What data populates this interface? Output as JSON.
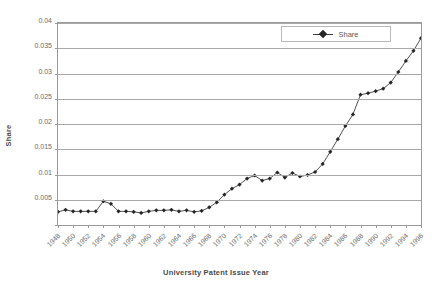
{
  "chart_data": {
    "type": "line",
    "title": "",
    "xlabel": "University Patent Issue Year",
    "ylabel": "Share",
    "xlim": [
      1948,
      1996
    ],
    "ylim": [
      0,
      0.04
    ],
    "grid": true,
    "legend_position": "top-right",
    "y_ticks": [
      0,
      0.005,
      0.01,
      0.015,
      0.02,
      0.025,
      0.03,
      0.035,
      0.04
    ],
    "y_tick_labels": [
      "",
      "0.005",
      "0.01",
      "0.015",
      "0.02",
      "0.025",
      "0.03",
      "0.035",
      "0.04"
    ],
    "x_ticks": [
      1948,
      1950,
      1952,
      1954,
      1956,
      1958,
      1960,
      1962,
      1964,
      1966,
      1968,
      1970,
      1972,
      1974,
      1976,
      1978,
      1980,
      1982,
      1984,
      1986,
      1988,
      1990,
      1992,
      1994,
      1996
    ],
    "x_tick_labels": [
      "1948",
      "1950",
      "1952",
      "1954",
      "1956",
      "1958",
      "1960",
      "1962",
      "1964",
      "1966",
      "1968",
      "1970",
      "1972",
      "1974",
      "1976",
      "1978",
      "1980",
      "1982",
      "1984",
      "1986",
      "1988",
      "1990",
      "1992",
      "1994",
      "1996"
    ],
    "series": [
      {
        "name": "Share",
        "color": "#262626",
        "marker": "diamond",
        "x": [
          1948,
          1949,
          1950,
          1951,
          1952,
          1953,
          1954,
          1955,
          1956,
          1957,
          1958,
          1959,
          1960,
          1961,
          1962,
          1963,
          1964,
          1965,
          1966,
          1967,
          1968,
          1969,
          1970,
          1971,
          1972,
          1973,
          1974,
          1975,
          1976,
          1977,
          1978,
          1979,
          1980,
          1981,
          1982,
          1983,
          1984,
          1985,
          1986,
          1987,
          1988,
          1989,
          1990,
          1991,
          1992,
          1993,
          1994,
          1995,
          1996
        ],
        "values": [
          0.0026,
          0.003,
          0.0027,
          0.0027,
          0.0027,
          0.0027,
          0.0047,
          0.0042,
          0.0027,
          0.0027,
          0.0026,
          0.0024,
          0.0027,
          0.0029,
          0.0029,
          0.003,
          0.0027,
          0.0029,
          0.0026,
          0.0028,
          0.0035,
          0.0045,
          0.006,
          0.0072,
          0.008,
          0.0092,
          0.0098,
          0.0088,
          0.0092,
          0.0104,
          0.0094,
          0.0103,
          0.0096,
          0.0099,
          0.0105,
          0.0121,
          0.0145,
          0.017,
          0.0196,
          0.0219,
          0.0258,
          0.0261,
          0.0265,
          0.027,
          0.0282,
          0.0303,
          0.0325,
          0.0345,
          0.037
        ]
      }
    ]
  },
  "legend": {
    "entries": [
      {
        "label": "Share"
      }
    ]
  }
}
